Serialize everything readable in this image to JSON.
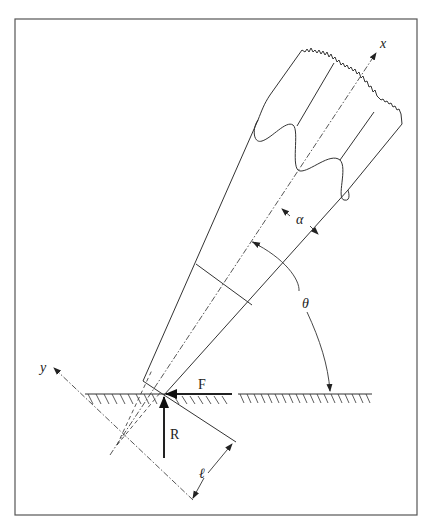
{
  "figure": {
    "labels": {
      "x_axis": "x",
      "y_axis": "y",
      "alpha": "α",
      "theta": "θ",
      "force_F": "F",
      "force_R": "R",
      "length": "ℓ"
    },
    "elements": [
      "tool-body",
      "cutting-edges",
      "x-axis",
      "y-axis",
      "ground-surface",
      "friction-force-F",
      "reaction-force-R",
      "angle-alpha",
      "angle-theta",
      "contact-length-l"
    ],
    "colors": {
      "line": "#333333",
      "frame": "#555555",
      "background": "#ffffff"
    }
  }
}
